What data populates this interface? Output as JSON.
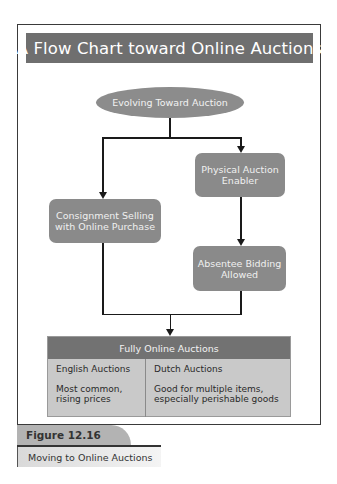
{
  "diagram": {
    "title": "A Flow Chart toward Online Auctions",
    "start_node": "Evolving Toward Auction",
    "nodes": {
      "physical": [
        "Physical Auction",
        "Enabler"
      ],
      "consignment": [
        "Consignment Selling",
        "with Online Purchase"
      ],
      "absentee": [
        "Absentee Bidding",
        "Allowed"
      ]
    },
    "end_table": {
      "header": "Fully Online Auctions",
      "columns": [
        {
          "heading": "English Auctions",
          "desc_lines": [
            "Most common,",
            "rising prices"
          ]
        },
        {
          "heading": "Dutch Auctions",
          "desc_lines": [
            "Good for multiple items,",
            "especially perishable goods"
          ]
        }
      ]
    },
    "edges": [
      {
        "from": "Evolving Toward Auction",
        "to": "Consignment Selling with Online Purchase"
      },
      {
        "from": "Evolving Toward Auction",
        "to": "Physical Auction Enabler"
      },
      {
        "from": "Physical Auction Enabler",
        "to": "Absentee Bidding Allowed"
      },
      {
        "from": "Consignment Selling with Online Purchase",
        "to": "Fully Online Auctions"
      },
      {
        "from": "Absentee Bidding Allowed",
        "to": "Fully Online Auctions"
      }
    ]
  },
  "figure": {
    "label": "Figure 12.16",
    "caption": "Moving to Online Auctions"
  },
  "colors": {
    "title_bar": "#6f6f6f",
    "node_fill": "#8a8a8a",
    "table_header": "#727272",
    "table_body": "#c9c9c9",
    "figure_label": "#b3b3b3"
  }
}
